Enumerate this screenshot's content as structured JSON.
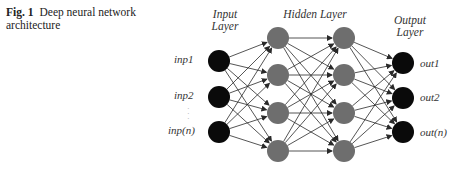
{
  "caption": {
    "figure_number": "Fig. 1",
    "title": "Deep neural network architecture"
  },
  "layers": {
    "input": {
      "label_line1": "Input",
      "label_line2": "Layer"
    },
    "hidden": {
      "label": "Hidden Layer"
    },
    "output": {
      "label_line1": "Output",
      "label_line2": "Layer"
    }
  },
  "inputs": [
    "inp1",
    "inp2",
    "inp(n)"
  ],
  "outputs": [
    "out1",
    "out2",
    "out(n)"
  ],
  "colors": {
    "input_node": "#0a0a0a",
    "hidden_node": "#6e6e6e",
    "output_node": "#0a0a0a",
    "edge": "#2a2a2a"
  },
  "structure": {
    "input_nodes": 3,
    "hidden_layers": 2,
    "hidden_nodes_per_layer": 4,
    "output_nodes": 3
  }
}
